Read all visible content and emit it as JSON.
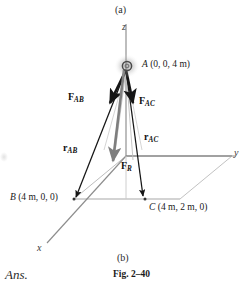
{
  "figure": {
    "panel_top_tag": "(a)",
    "panel_bottom_tag": "(b)",
    "caption": "Fig. 2–40",
    "answer_tag": "Ans."
  },
  "axes": {
    "z_label": "z",
    "y_label": "y",
    "x_label": "x"
  },
  "points": {
    "a_label": "A",
    "a_coords": "(0, 0, 4 m)",
    "b_label": "B",
    "b_coords": "(4 m, 0, 0)",
    "c_label": "C",
    "c_coords": "(4 m, 2 m, 0)"
  },
  "vectors": {
    "f_ab": "F",
    "f_ab_sub": "AB",
    "f_ac": "F",
    "f_ac_sub": "AC",
    "f_r": "F",
    "f_r_sub": "R",
    "r_ab": "r",
    "r_ab_sub": "AB",
    "r_ac": "r",
    "r_ac_sub": "AC"
  },
  "colors": {
    "axis_gray": "#8d8d8d",
    "force_black": "#151515",
    "resultant_gray": "#7e7e7e",
    "ground_gray": "#a0a0a0",
    "thin_gray": "#b4b4b4",
    "text_black": "#1a1a1a"
  }
}
